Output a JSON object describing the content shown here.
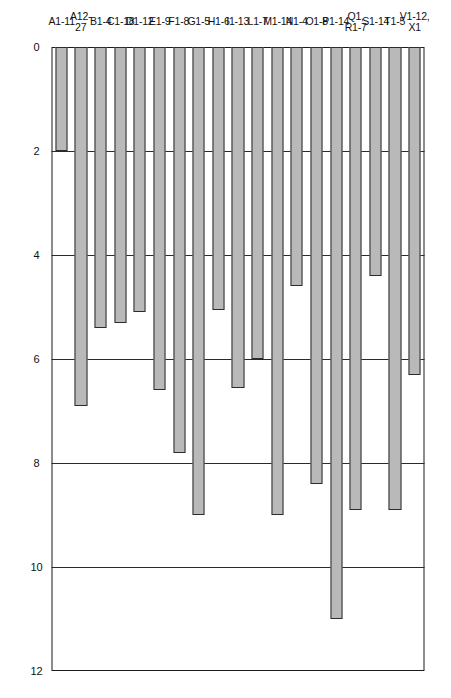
{
  "chart_data": {
    "type": "bar",
    "orientation": "vertical-rotated",
    "title": "",
    "xlabel": "",
    "ylabel": "",
    "ylim": [
      0,
      12
    ],
    "yticks": [
      0,
      2,
      4,
      6,
      8,
      10,
      12
    ],
    "ytick_labels": [
      "0",
      "2",
      "4",
      "6",
      "8",
      "10",
      "12"
    ],
    "grid": true,
    "legend": null,
    "bar_fill_color": "#b9b9b9",
    "bar_edge_color": "#2c2c2c",
    "axis_color": "#1b1b1b",
    "categories": [
      "A1-11",
      "A12-\n27",
      "B1-4",
      "C1-18",
      "D1-12",
      "E1-9",
      "F1-8",
      "G1-5",
      "H1-6",
      "I1-13",
      "L1-7",
      "M1-14",
      "N1-4",
      "O1-8",
      "P1-14",
      "Q1,\nR1-7",
      "S1-14",
      "T1-5",
      "V1-12,\nX1"
    ],
    "values": [
      2.0,
      6.9,
      5.4,
      5.3,
      5.1,
      6.6,
      7.8,
      9.0,
      5.05,
      6.55,
      6.0,
      9.0,
      4.6,
      8.4,
      11.0,
      8.9,
      4.4,
      8.9,
      6.3
    ]
  }
}
